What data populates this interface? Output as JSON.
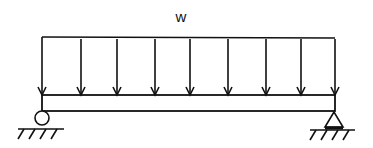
{
  "diagram": {
    "load_label": "w",
    "load_type": "uniformly-distributed-load",
    "load_arrow_count": 9,
    "load_arrow_x": [
      42,
      81,
      117,
      155,
      190,
      228,
      266,
      301,
      335
    ],
    "left_support": "roller",
    "right_support": "pin",
    "stroke_color": "#111111",
    "background_color": "#ffffff"
  }
}
